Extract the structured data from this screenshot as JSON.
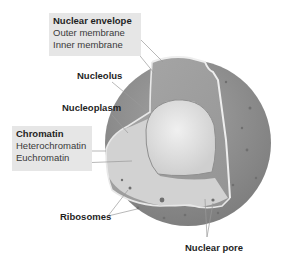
{
  "diagram": {
    "groups": [
      {
        "id": "nuclear-envelope",
        "heading": "Nuclear envelope",
        "items": [
          "Outer membrane",
          "Inner membrane"
        ]
      },
      {
        "id": "chromatin",
        "heading": "Chromatin",
        "items": [
          "Heterochromatin",
          "Euchromatin"
        ]
      }
    ],
    "labels": {
      "nucleolus": "Nucleolus",
      "nucleoplasm": "Nucleoplasm",
      "ribosomes": "Ribosomes",
      "nuclear_pore": "Nuclear pore"
    },
    "colors": {
      "outer_sphere": "#8a8a8a",
      "cut_face": "#9d9d9d",
      "nucleoplasm": "#d4d4d4",
      "nucleolus": "#e4e4e4",
      "membrane_edge": "#f0f0f0",
      "label_box": "#e6e6e6",
      "leader_line": "#9a9a9a",
      "ribosome_dot": "#6f6f6f"
    }
  }
}
